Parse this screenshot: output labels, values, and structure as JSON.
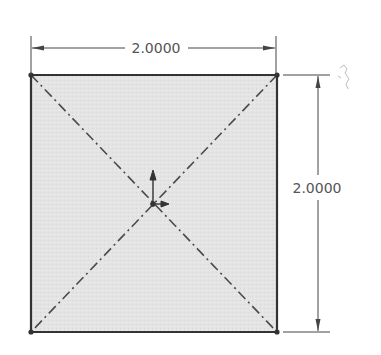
{
  "sketch": {
    "shape": "square",
    "fill_color": "#e6e6e6",
    "edge_color": "#3a3a3a",
    "centerline_color": "#444444"
  },
  "dimensions": {
    "horizontal": {
      "label": "2.0000"
    },
    "vertical": {
      "label": "2.0000"
    }
  },
  "icons": {
    "origin": "origin-axes-icon",
    "cursor": "sketch-cursor-icon"
  }
}
